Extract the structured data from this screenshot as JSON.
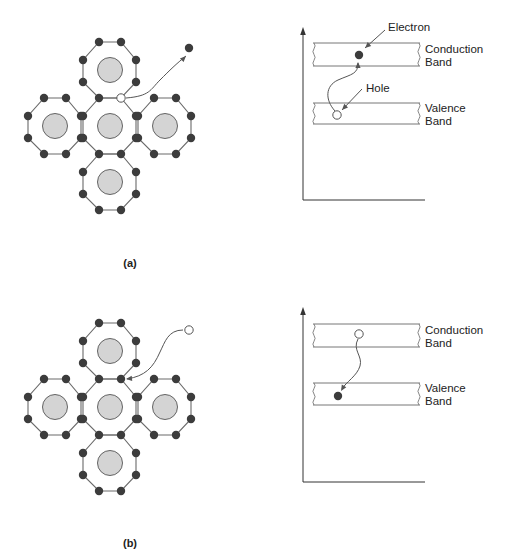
{
  "figure": {
    "background": "#ffffff",
    "colors": {
      "bond_line": "#6a6a6a",
      "electron_fill": "#3c3c3c",
      "atom_fill": "#d4d4d4",
      "atom_stroke": "#555555",
      "hole_fill": "#ffffff",
      "hole_stroke": "#555555",
      "band_line": "#777777",
      "axis_line": "#333333",
      "curve_line": "#555555"
    }
  },
  "panels": [
    {
      "id": "a",
      "label": "(a)",
      "label_pos": [
        130,
        267
      ],
      "lattice": {
        "offset_y": 0,
        "atom_centers": [
          [
            110,
            70
          ],
          [
            55,
            126
          ],
          [
            110,
            126
          ],
          [
            165,
            126
          ],
          [
            110,
            182
          ]
        ],
        "hole_site": [
          121,
          98
        ],
        "free_carrier": {
          "type": "electron",
          "pos": [
            189,
            48
          ]
        },
        "transition_path": "M126,98 C150,96 150,90 160,80 C170,70 176,64 186,56",
        "arrow_end": [
          186,
          56
        ],
        "arrow_dir": [
          0.7,
          -0.7
        ]
      },
      "band_diagram": {
        "axis_x": 303,
        "axis_top": 27,
        "axis_bottom": 200,
        "axis_right": 425,
        "band_left": 314,
        "band_right": 419,
        "conduction": {
          "top": 43,
          "bottom": 66,
          "label_line1": "Conduction",
          "label_line2": "Band"
        },
        "valence": {
          "top": 103,
          "bottom": 124,
          "label_line1": "Valence",
          "label_line2": "Band"
        },
        "upper_marker": {
          "type": "electron",
          "pos": [
            359,
            55
          ]
        },
        "lower_marker": {
          "type": "hole",
          "pos": [
            337,
            115
          ]
        },
        "transition_path": "M335,111 C325,100 325,86 338,80 C352,74 358,74 358,63",
        "transition_arrow_end": [
          358,
          62
        ],
        "transition_arrow_dir": [
          0,
          -1
        ],
        "callouts": [
          {
            "text": "Electron",
            "text_pos": [
              388,
              31
            ],
            "line_from": [
              385,
              30
            ],
            "line_to": [
              365,
              48
            ]
          },
          {
            "text": "Hole",
            "text_pos": [
              366,
              92
            ],
            "line_from": [
              362,
              89
            ],
            "line_to": [
              342,
              110
            ]
          }
        ]
      }
    },
    {
      "id": "b",
      "label": "(b)",
      "label_pos": [
        130,
        547
      ],
      "lattice": {
        "offset_y": 281,
        "atom_centers": [
          [
            110,
            70
          ],
          [
            55,
            126
          ],
          [
            110,
            126
          ],
          [
            165,
            126
          ],
          [
            110,
            182
          ]
        ],
        "hole_site": null,
        "free_carrier": {
          "type": "hole",
          "pos": [
            189,
            330
          ]
        },
        "transition_path": "M183,330 C168,330 165,342 160,352 C153,368 145,376 127,379",
        "arrow_end": [
          126,
          379
        ],
        "arrow_dir": [
          -1,
          0.1
        ]
      },
      "band_diagram": {
        "axis_x": 303,
        "axis_top": 307,
        "axis_bottom": 482,
        "axis_right": 425,
        "band_left": 314,
        "band_right": 419,
        "conduction": {
          "top": 324,
          "bottom": 347,
          "label_line1": "Conduction",
          "label_line2": "Band"
        },
        "valence": {
          "top": 383,
          "bottom": 405,
          "label_line1": "Valence",
          "label_line2": "Band"
        },
        "upper_marker": {
          "type": "hole",
          "pos": [
            359,
            334
          ]
        },
        "lower_marker": {
          "type": "electron",
          "pos": [
            338,
            396
          ]
        },
        "transition_path": "M358,339 C352,350 363,356 360,366 C357,376 346,382 342,389",
        "transition_arrow_end": [
          341,
          391
        ],
        "transition_arrow_dir": [
          -0.5,
          0.85
        ],
        "callouts": []
      }
    }
  ]
}
